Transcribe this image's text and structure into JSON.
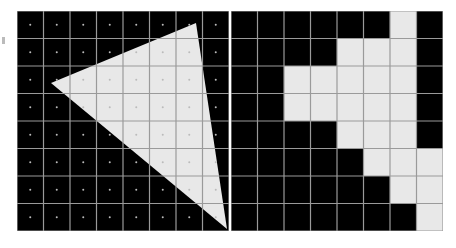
{
  "figure": {
    "left_panel": {
      "label": "continuous-triangle",
      "cols": 8,
      "rows": 8,
      "triangle_vertices": [
        [
          34,
          72
        ],
        [
          179,
          12
        ],
        [
          210,
          218
        ]
      ],
      "sample_dots": true
    },
    "right_panel": {
      "label": "rasterized-triangle",
      "cols": 8,
      "rows": 8,
      "mask": [
        [
          0,
          0,
          0,
          0,
          0,
          0,
          1,
          0
        ],
        [
          0,
          0,
          0,
          0,
          1,
          1,
          1,
          0
        ],
        [
          0,
          0,
          1,
          1,
          1,
          1,
          1,
          0
        ],
        [
          0,
          0,
          1,
          1,
          1,
          1,
          1,
          0
        ],
        [
          0,
          0,
          0,
          0,
          1,
          1,
          1,
          0
        ],
        [
          0,
          0,
          0,
          0,
          0,
          1,
          1,
          1
        ],
        [
          0,
          0,
          0,
          0,
          0,
          0,
          1,
          1
        ],
        [
          0,
          0,
          0,
          0,
          0,
          0,
          0,
          1
        ]
      ]
    },
    "colors": {
      "background": "#000000",
      "fill": "#e8e8e8",
      "grid": "#9a9a9a",
      "dot": "#bbbbbb",
      "dot_on_fill": "#d0d0d0"
    }
  }
}
